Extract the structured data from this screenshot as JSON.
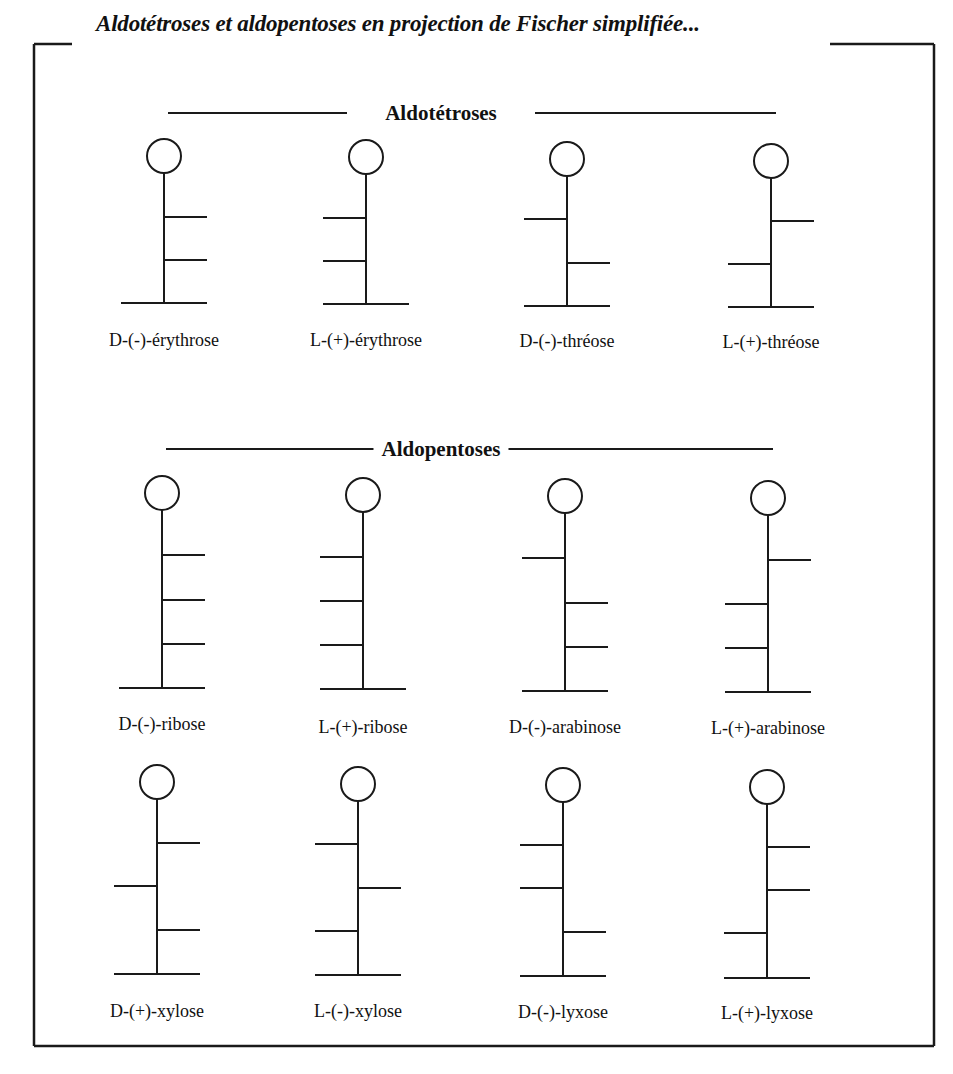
{
  "title": "Aldotétroses et aldopentoses en projection de Fischer simplifiée...",
  "colors": {
    "ink": "#1a1a1a",
    "background": "#ffffff"
  },
  "frame": {
    "left": 34,
    "top": 44,
    "right": 934,
    "bottom": 1046,
    "title_gap_start": 72,
    "title_gap_end": 830
  },
  "sections": [
    {
      "id": "aldotetroses",
      "label": "Aldotétroses",
      "center_x": 441,
      "y": 113,
      "line_left": [
        168,
        347
      ],
      "line_right": [
        535,
        776
      ]
    },
    {
      "id": "aldopentoses",
      "label": "Aldopentoses",
      "center_x": 441,
      "y": 449,
      "line_left": [
        166,
        392
      ],
      "line_right": [
        490,
        773
      ]
    }
  ],
  "molecules": [
    {
      "name": "D-(-)-érythrose",
      "section": "aldotetroses",
      "x": 164,
      "cy": 156,
      "r": 17,
      "branches": [
        {
          "y": 217,
          "side": "right"
        },
        {
          "y": 260,
          "side": "right"
        }
      ],
      "bottom": 303,
      "label_y": 330
    },
    {
      "name": "L-(+)-érythrose",
      "section": "aldotetroses",
      "x": 366,
      "cy": 157,
      "r": 17,
      "branches": [
        {
          "y": 218,
          "side": "left"
        },
        {
          "y": 261,
          "side": "left"
        }
      ],
      "bottom": 304,
      "label_y": 330
    },
    {
      "name": "D-(-)-thréose",
      "section": "aldotetroses",
      "x": 567,
      "cy": 159,
      "r": 17,
      "branches": [
        {
          "y": 219,
          "side": "left"
        },
        {
          "y": 263,
          "side": "right"
        }
      ],
      "bottom": 306,
      "label_y": 331
    },
    {
      "name": "L-(+)-thréose",
      "section": "aldotetroses",
      "x": 771,
      "cy": 161,
      "r": 17,
      "branches": [
        {
          "y": 221,
          "side": "right"
        },
        {
          "y": 264,
          "side": "left"
        }
      ],
      "bottom": 307,
      "label_y": 332
    },
    {
      "name": "D-(-)-ribose",
      "section": "aldopentoses",
      "x": 162,
      "cy": 493,
      "r": 17,
      "branches": [
        {
          "y": 555,
          "side": "right"
        },
        {
          "y": 600,
          "side": "right"
        },
        {
          "y": 644,
          "side": "right"
        }
      ],
      "bottom": 688,
      "label_y": 714
    },
    {
      "name": "L-(+)-ribose",
      "section": "aldopentoses",
      "x": 363,
      "cy": 495,
      "r": 17,
      "branches": [
        {
          "y": 557,
          "side": "left"
        },
        {
          "y": 601,
          "side": "left"
        },
        {
          "y": 645,
          "side": "left"
        }
      ],
      "bottom": 689,
      "label_y": 717
    },
    {
      "name": "D-(-)-arabinose",
      "section": "aldopentoses",
      "x": 565,
      "cy": 496,
      "r": 17,
      "branches": [
        {
          "y": 558,
          "side": "left"
        },
        {
          "y": 603,
          "side": "right"
        },
        {
          "y": 647,
          "side": "right"
        }
      ],
      "bottom": 691,
      "label_y": 717
    },
    {
      "name": "L-(+)-arabinose",
      "section": "aldopentoses",
      "x": 768,
      "cy": 498,
      "r": 17,
      "branches": [
        {
          "y": 560,
          "side": "right"
        },
        {
          "y": 604,
          "side": "left"
        },
        {
          "y": 648,
          "side": "left"
        }
      ],
      "bottom": 692,
      "label_y": 718
    },
    {
      "name": "D-(+)-xylose",
      "section": "aldopentoses",
      "x": 157,
      "cy": 782,
      "r": 17,
      "branches": [
        {
          "y": 843,
          "side": "right"
        },
        {
          "y": 886,
          "side": "left"
        },
        {
          "y": 930,
          "side": "right"
        }
      ],
      "bottom": 974,
      "label_y": 1001
    },
    {
      "name": "L-(-)-xylose",
      "section": "aldopentoses",
      "x": 358,
      "cy": 784,
      "r": 17,
      "branches": [
        {
          "y": 844,
          "side": "left"
        },
        {
          "y": 888,
          "side": "right"
        },
        {
          "y": 931,
          "side": "left"
        }
      ],
      "bottom": 975,
      "label_y": 1001
    },
    {
      "name": "D-(-)-lyxose",
      "section": "aldopentoses",
      "x": 563,
      "cy": 785,
      "r": 17,
      "branches": [
        {
          "y": 845,
          "side": "left"
        },
        {
          "y": 888,
          "side": "left"
        },
        {
          "y": 932,
          "side": "right"
        }
      ],
      "bottom": 976,
      "label_y": 1002
    },
    {
      "name": "L-(+)-lyxose",
      "section": "aldopentoses",
      "x": 767,
      "cy": 787,
      "r": 17,
      "branches": [
        {
          "y": 847,
          "side": "right"
        },
        {
          "y": 890,
          "side": "right"
        },
        {
          "y": 933,
          "side": "left"
        }
      ],
      "bottom": 978,
      "label_y": 1003
    }
  ],
  "geometry": {
    "branch_length": 43,
    "bottom_half_left": 43,
    "bottom_half_right": 43,
    "stroke_width": 2,
    "frame_stroke_width": 2.5
  }
}
